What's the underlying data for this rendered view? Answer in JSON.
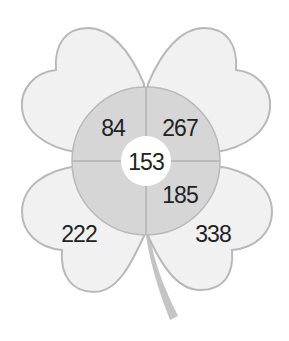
{
  "diagram": {
    "type": "four-leaf-clover",
    "center_value": "153",
    "inner_ring": {
      "top_left": "84",
      "top_right": "267",
      "bottom_right": "185",
      "bottom_left": ""
    },
    "leaves": {
      "top_left": "",
      "top_right": "",
      "bottom_left": "222",
      "bottom_right": "338"
    }
  },
  "colors": {
    "leaf_fill": "#f1f1f1",
    "leaf_stroke": "#b9b9b9",
    "ring_fill": "#d6d6d6",
    "divider": "#b3b3b3",
    "center_fill": "#ffffff",
    "stem": "#c4c4c4",
    "text": "#222222"
  }
}
